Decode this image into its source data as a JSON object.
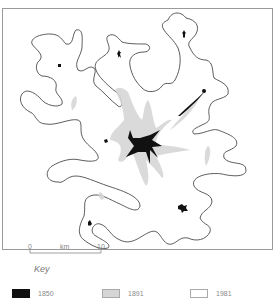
{
  "map": {
    "title": "Urban growth map",
    "scale_bar": {
      "start_label": "0",
      "unit_label": "km",
      "end_label": "10"
    }
  },
  "key": {
    "title": "Key",
    "items": [
      {
        "label": "1850",
        "color": "#111111"
      },
      {
        "label": "1891",
        "color": "#d6d6d6"
      },
      {
        "label": "1981",
        "color": "#ffffff"
      }
    ]
  }
}
